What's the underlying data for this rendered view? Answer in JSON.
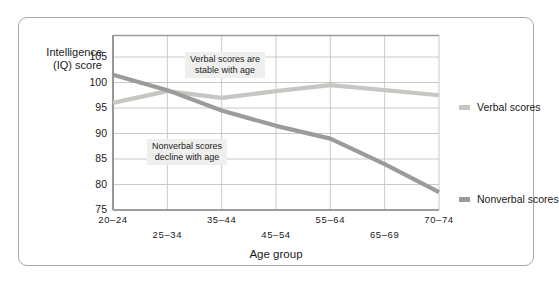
{
  "chart_data": {
    "type": "line",
    "title": "",
    "xlabel": "Age group",
    "ylabel": "Intelligence (IQ) score",
    "ylabel_line1": "Intelligence",
    "ylabel_line2": "(IQ) score",
    "categories": [
      "20–24",
      "25–34",
      "35–44",
      "45–54",
      "55–64",
      "65–69",
      "70–74"
    ],
    "yticks": [
      105,
      100,
      95,
      90,
      85,
      80,
      75
    ],
    "ylim": [
      75,
      108
    ],
    "grid": true,
    "legend_position": "right",
    "series": [
      {
        "name": "Verbal scores",
        "color": "#c6c6c2",
        "values": [
          96.0,
          98.3,
          97.0,
          98.3,
          99.5,
          98.5,
          97.5
        ]
      },
      {
        "name": "Nonverbal scores",
        "color": "#9b9b99",
        "values": [
          101.5,
          98.5,
          94.5,
          91.5,
          89.0,
          84.0,
          78.5
        ]
      }
    ],
    "annotations": [
      {
        "id": "verbal-note",
        "line1": "Verbal scores are",
        "line2": "stable with age"
      },
      {
        "id": "nonverbal-note",
        "line1": "Nonverbal scores",
        "line2": "decline with age"
      }
    ]
  },
  "legend": {
    "items": [
      {
        "label": "Verbal scores",
        "color": "#c6c6c2"
      },
      {
        "label": "Nonverbal scores",
        "color": "#9b9b99"
      }
    ]
  },
  "colors": {
    "verbal": "#c6c6c2",
    "nonverbal": "#9b9b99",
    "grid": "#bdbdbd",
    "axis": "#6d6d6d",
    "frame_border": "#a8a8a8",
    "annotation_background": "#efefee",
    "text": "#1a1a1a"
  }
}
